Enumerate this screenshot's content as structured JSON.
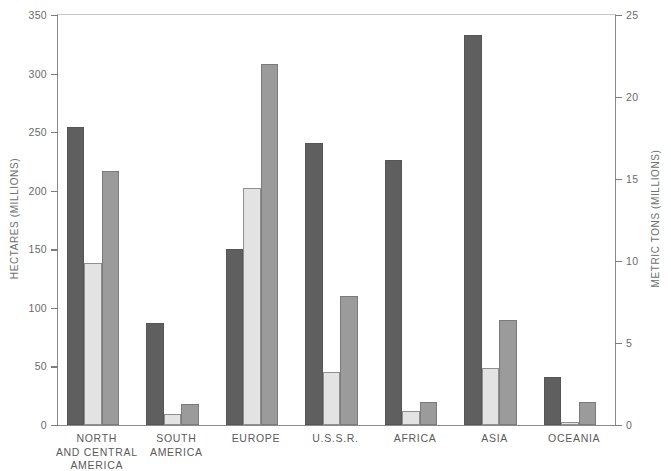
{
  "chart_data": {
    "type": "bar",
    "title": "",
    "subtitle": "",
    "categories": [
      "NORTH\nAND CENTRAL\nAMERICA",
      "SOUTH\nAMERICA",
      "EUROPE",
      "U.S.S.R.",
      "AFRICA",
      "ASIA",
      "OCEANIA"
    ],
    "series": [
      {
        "name": "series-1-dark",
        "axis": "left",
        "color": "#5f5f5f",
        "values": [
          254,
          87,
          150,
          241,
          226,
          333,
          41
        ]
      },
      {
        "name": "series-2-light",
        "axis": "left",
        "color": "#e3e3e3",
        "values": [
          138,
          9,
          202,
          45,
          12,
          49,
          3
        ]
      },
      {
        "name": "series-3-medium",
        "axis": "right",
        "color": "#9b9b9b",
        "values": [
          217,
          18,
          308,
          110,
          20,
          90,
          20
        ]
      }
    ],
    "xlabel": "",
    "ylabel": "HECTARES (MILLIONS)",
    "ylabel_right": "METRIC TONS (MILLIONS)",
    "ylim": [
      0,
      350
    ],
    "yticks": [
      0,
      50,
      100,
      150,
      200,
      250,
      300,
      350
    ],
    "ylim_right": [
      0,
      25
    ],
    "yticks_right": [
      0,
      5,
      10,
      15,
      20,
      25
    ],
    "grid": false,
    "legend": "none"
  },
  "axes": {
    "left_title": "HECTARES (MILLIONS)",
    "right_title": "METRIC TONS (MILLIONS)",
    "left_ticks": [
      "0",
      "50",
      "100",
      "150",
      "200",
      "250",
      "300",
      "350"
    ],
    "right_ticks": [
      "0",
      "5",
      "10",
      "15",
      "20",
      "25"
    ]
  },
  "categories": [
    "NORTH\nAND CENTRAL\nAMERICA",
    "SOUTH\nAMERICA",
    "EUROPE",
    "U.S.S.R.",
    "AFRICA",
    "ASIA",
    "OCEANIA"
  ]
}
